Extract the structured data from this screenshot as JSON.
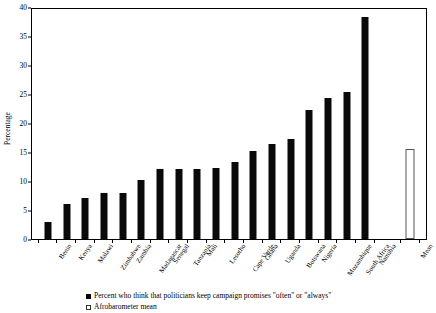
{
  "chart_data": {
    "type": "bar",
    "title": "",
    "xlabel": "",
    "ylabel": "Percentage",
    "ylim": [
      0,
      40
    ],
    "ytick_step": 5,
    "yticks": [
      "0",
      "5",
      "10",
      "15",
      "20",
      "25",
      "30",
      "35",
      "40"
    ],
    "grid": false,
    "legend_position": "bottom-center",
    "categories": [
      "Benin",
      "Kenya",
      "Malawi",
      "Zimbabwe",
      "Zambia",
      "Madagascar",
      "Senegal",
      "Tanzania",
      "Mali",
      "Lesotho",
      "Cape Verde",
      "Ghana",
      "Uganda",
      "Botswana",
      "Nigeria",
      "Mozambique",
      "South Africa",
      "Namibia",
      "Mean"
    ],
    "values": [
      3.0,
      6.0,
      7.0,
      8.0,
      8.0,
      10.1,
      12.1,
      12.1,
      12.1,
      12.2,
      13.2,
      15.2,
      16.3,
      17.2,
      22.3,
      24.3,
      25.3,
      38.2,
      15.5
    ],
    "series": [
      {
        "name": "Percent who think that politicians keep campaign promises \"often\" or \"always\"",
        "style": "filled",
        "color": "#0a0a0a"
      },
      {
        "name": "Afrobarometer mean",
        "style": "hollow",
        "color": "#ffffff"
      }
    ],
    "mean_index": 18,
    "gap_before_mean": true
  },
  "legend": {
    "items": [
      {
        "swatch": "filled-square",
        "label": "Percent who think that politicians keep campaign promises \"often\" or \"always\""
      },
      {
        "swatch": "hollow-square",
        "label": "Afrobarometer mean"
      }
    ]
  },
  "colors": {
    "bar": "#0a0a0a",
    "mean_bar_fill": "#ffffff",
    "mean_bar_stroke": "#555555",
    "axis": "#000000",
    "background": "#ffffff"
  }
}
